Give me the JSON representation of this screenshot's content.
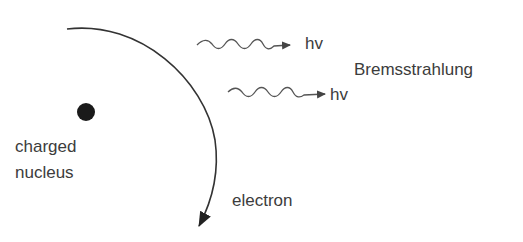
{
  "diagram": {
    "nucleus_label_line1": "charged",
    "nucleus_label_line2": "nucleus",
    "electron_label": "electron",
    "photon_label_1": "hv",
    "photon_label_2": "hv",
    "process_label": "Bremsstrahlung",
    "colors": {
      "line": "#333333",
      "wave": "#555555",
      "nucleus": "#1a1a1a",
      "text": "#3c3c3c"
    }
  }
}
